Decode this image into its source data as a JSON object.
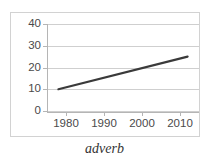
{
  "caption": "adverb",
  "chart_data": {
    "type": "line",
    "title": "",
    "xlabel": "",
    "ylabel": "",
    "x": [
      1978,
      2012
    ],
    "values": [
      10,
      25
    ],
    "series": [
      {
        "name": "adverb",
        "x": [
          1978,
          2012
        ],
        "values": [
          10,
          25
        ],
        "color": "#3a3a3a"
      }
    ],
    "x_tick_labels": [
      "1980",
      "1990",
      "2000",
      "2010"
    ],
    "x_tick_values": [
      1980,
      1990,
      2000,
      2010
    ],
    "y_tick_labels": [
      "0",
      "10",
      "20",
      "30",
      "40"
    ],
    "y_tick_values": [
      0,
      10,
      20,
      30,
      40
    ],
    "xlim": [
      1975,
      2015
    ],
    "ylim": [
      0,
      40
    ],
    "grid": "horizontal",
    "legend": "none",
    "line_color": "#3a3a3a",
    "gridline_color": "#cfcfcf",
    "axis_color": "#b5b5b5",
    "border_color": "#d2d2d2",
    "background": "#ffffff"
  }
}
